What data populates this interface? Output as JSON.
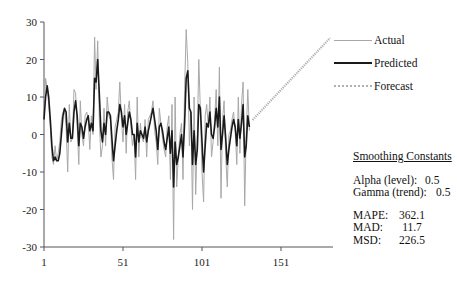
{
  "chart_data": {
    "type": "line",
    "title": "",
    "xlabel": "",
    "ylabel": "",
    "xlim": [
      1,
      190
    ],
    "ylim": [
      -30,
      30
    ],
    "x_ticks": [
      1,
      51,
      101,
      151
    ],
    "y_ticks": [
      -30,
      -20,
      -10,
      0,
      10,
      20,
      30
    ],
    "grid": false,
    "legend_position": "right",
    "series": [
      {
        "name": "Actual",
        "style": "thin gray",
        "color": "#a8a8a8",
        "x_start": 1,
        "values": [
          4,
          15,
          12,
          8,
          2,
          -6,
          -8,
          -3,
          -7,
          -5,
          -2,
          4,
          6,
          7,
          2,
          -10,
          8,
          -2,
          -1,
          12,
          11,
          2,
          -8,
          9,
          0,
          -3,
          5,
          6,
          4,
          -4,
          5,
          0,
          26,
          12,
          25,
          4,
          -6,
          -3,
          7,
          -3,
          10,
          5,
          4,
          -6,
          -12,
          2,
          4,
          6,
          14,
          4,
          -2,
          8,
          -5,
          6,
          9,
          2,
          -3,
          0,
          -12,
          10,
          -6,
          3,
          -1,
          -2,
          4,
          -6,
          4,
          5,
          6,
          9,
          1,
          -2,
          -8,
          7,
          3,
          -1,
          -4,
          -6,
          2,
          5,
          -12,
          8,
          -28,
          10,
          -14,
          -6,
          0,
          3,
          -12,
          12,
          28,
          19,
          -3,
          6,
          -20,
          10,
          -16,
          0,
          20,
          6,
          -10,
          -18,
          5,
          8,
          2,
          10,
          -6,
          -2,
          4,
          12,
          -3,
          18,
          -17,
          4,
          9,
          -6,
          -14,
          0,
          1,
          4,
          6,
          1,
          -8,
          10,
          -5,
          8,
          14,
          -19,
          0,
          12,
          1
        ]
      },
      {
        "name": "Predicted",
        "style": "thick black",
        "color": "#1a1a1a",
        "x_start": 1,
        "values": [
          4,
          10,
          13,
          10,
          4,
          -3,
          -7,
          -6,
          -7,
          -7,
          -5,
          0,
          5,
          7,
          6,
          -2,
          3,
          -1,
          -1,
          6,
          9,
          5,
          -3,
          3,
          2,
          -1,
          2,
          4,
          5,
          1,
          3,
          1,
          15,
          14,
          20,
          11,
          1,
          -2,
          3,
          0,
          6,
          6,
          5,
          -1,
          -7,
          -3,
          1,
          4,
          8,
          6,
          2,
          5,
          0,
          3,
          6,
          4,
          0,
          0,
          -6,
          3,
          -2,
          1,
          0,
          -1,
          2,
          -2,
          1,
          3,
          5,
          7,
          4,
          1,
          -4,
          2,
          3,
          1,
          -2,
          -4,
          -1,
          2,
          -5,
          1,
          -14,
          -2,
          -8,
          -6,
          -3,
          0,
          -6,
          3,
          15,
          17,
          7,
          6,
          -8,
          1,
          -8,
          -4,
          8,
          7,
          -2,
          -10,
          -3,
          3,
          2,
          6,
          0,
          -1,
          2,
          7,
          2,
          10,
          -4,
          0,
          5,
          -1,
          -8,
          -4,
          -1,
          2,
          4,
          2,
          -3,
          4,
          -1,
          3,
          8,
          -6,
          -3,
          5,
          2
        ]
      },
      {
        "name": "Forecast",
        "style": "dotted light gray",
        "color": "#b0b0b0",
        "x": [
          133,
          182
        ],
        "values": [
          3.9,
          25.7
        ]
      }
    ]
  },
  "legend": {
    "items": [
      {
        "label": "Actual"
      },
      {
        "label": "Predicted"
      },
      {
        "label": "Forecast"
      }
    ]
  },
  "stats": {
    "title": "Smoothing Constants",
    "alpha_label": "Alpha (level):",
    "alpha_value": "0.5",
    "gamma_label": "Gamma (trend):",
    "gamma_value": "0.5",
    "mape_label": "MAPE:",
    "mape_value": "362.1",
    "mad_label": "MAD:",
    "mad_value": "11.7",
    "msd_label": "MSD:",
    "msd_value": "226.5"
  }
}
